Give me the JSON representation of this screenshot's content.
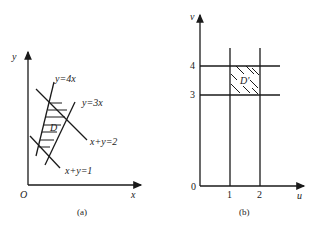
{
  "panel_a": {
    "caption": "(a)",
    "axis_x": "x",
    "axis_y": "y",
    "origin": "O",
    "lines": {
      "y4x": "y=4x",
      "y3x": "y=3x",
      "xy2": "x+y=2",
      "xy1": "x+y=1"
    },
    "region": "D"
  },
  "panel_b": {
    "caption": "(b)",
    "axis_x": "u",
    "axis_y": "v",
    "origin": "0",
    "ticks_u": [
      "1",
      "2"
    ],
    "ticks_v": [
      "3",
      "4"
    ],
    "region": "D'"
  }
}
